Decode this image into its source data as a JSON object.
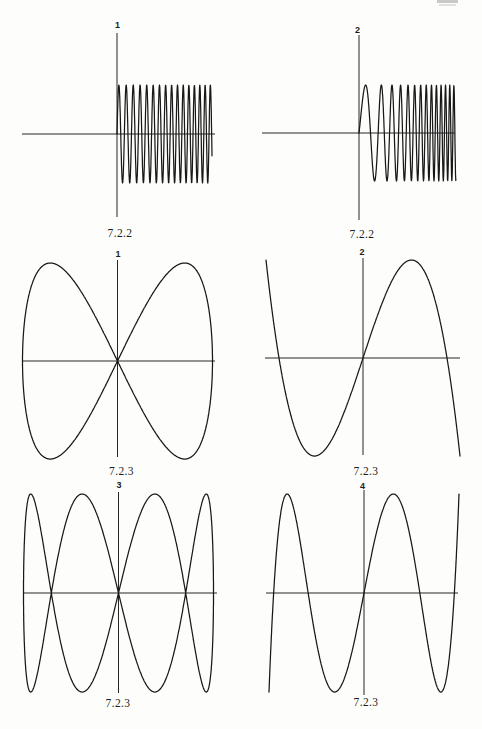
{
  "page": {
    "kind": "scanned textbook answer page with six function plots",
    "background": "#fdfdfb",
    "ink": "#1d1d1d",
    "header_artifact": {
      "note": "faint page-header text cropped off at the very top-right edge, illegible",
      "color": "#bfbfbf",
      "bars": [
        {
          "x": 437,
          "y": 0,
          "w": 21,
          "h": 3
        },
        {
          "x": 439,
          "y": 4,
          "w": 17,
          "h": 2
        }
      ]
    }
  },
  "chart_data": {
    "type": "line",
    "title": "",
    "grid": false,
    "legend": "none",
    "figures": [
      {
        "label": "1",
        "caption": "7.2.2",
        "curve_type": "chirp",
        "formula": "y = sin(phi(x)) for x >= 0; frequency slowly increasing, about 15.5 oscillations, amplitude 1",
        "x_range": [
          0,
          1
        ],
        "y_range": [
          -1,
          1
        ],
        "amplitude": 1,
        "oscillations": 15.6,
        "layout": {
          "origin": [
            117,
            134
          ],
          "vaxis": [
            33,
            217
          ],
          "haxis": [
            22,
            215
          ],
          "u_max": 95,
          "amp_px": 49,
          "b": 0.84,
          "a": 0.002,
          "label_pos": [
            117.5,
            21
          ],
          "caption_pos": [
            120,
            227
          ]
        }
      },
      {
        "label": "2",
        "caption": "7.2.2",
        "curve_type": "chirp",
        "formula": "y = sin(phi(x)) for x >= 0; chirp with strongly increasing frequency, about 14 oscillations, amplitude 1",
        "x_range": [
          0,
          1
        ],
        "y_range": [
          -1,
          1
        ],
        "amplitude": 1,
        "oscillations": 13.8,
        "layout": {
          "origin": [
            359,
            133
          ],
          "vaxis": [
            35,
            220
          ],
          "haxis": [
            262,
            455
          ],
          "u_max": 97,
          "amp_px": 48,
          "b": 0.19,
          "a": 0.00725,
          "label_pos": [
            357.5,
            26
          ],
          "caption_pos": [
            362,
            228
          ]
        }
      },
      {
        "label": "1",
        "caption": "7.2.3",
        "curve_type": "lissajous",
        "n": 2,
        "formula": "x = sin t, y = sin 2t, t in [0, 2pi] (bow-tie Lissajous figure crossing at the origin)",
        "x_range": [
          -1,
          1
        ],
        "y_range": [
          -1,
          1
        ],
        "layout": {
          "origin": [
            117.5,
            361
          ],
          "vaxis": [
            260,
            457
          ],
          "haxis": [
            22,
            215
          ],
          "A": 95,
          "B": 98,
          "t_range": [
            0,
            6.2832
          ],
          "label_pos": [
            118,
            250
          ],
          "caption_pos": [
            121.5,
            465
          ]
        }
      },
      {
        "label": "2",
        "caption": "7.2.3",
        "curve_type": "chebyshev",
        "n": 3,
        "formula": "y = sin(3 arcsin x) = 3x - 4x^3, x in [-1, 1]; ends at (-1,1) and (1,-1), extrema +-1 at x = +-1/2, zeros at 0 and +-0.866",
        "x_range": [
          -1,
          1
        ],
        "y_range": [
          -1,
          1
        ],
        "layout": {
          "origin": [
            363,
            358
          ],
          "vaxis": [
            258,
            455
          ],
          "haxis": [
            265,
            460
          ],
          "A": 97,
          "B": 98,
          "t_range": [
            -1.5708,
            1.5708
          ],
          "label_pos": [
            362,
            248
          ],
          "caption_pos": [
            366,
            465
          ]
        }
      },
      {
        "label": "3",
        "caption": "7.2.3",
        "curve_type": "lissajous",
        "n": 4,
        "formula": "x = sin t, y = sin 4t, t in [0, 2pi] (braided figure, axis crossings at x = 0 and x = +-0.707)",
        "x_range": [
          -1,
          1
        ],
        "y_range": [
          -1,
          1
        ],
        "layout": {
          "origin": [
            118.5,
            593
          ],
          "vaxis": [
            492,
            693
          ],
          "haxis": [
            23,
            217
          ],
          "A": 95,
          "B": 99,
          "t_range": [
            0,
            6.2832
          ],
          "label_pos": [
            119,
            481
          ],
          "caption_pos": [
            118,
            697
          ]
        }
      },
      {
        "label": "4",
        "caption": "7.2.3",
        "curve_type": "chebyshev",
        "n": 5,
        "formula": "y = sin(5 arcsin x) = 16x^5 - 20x^3 + 5x, x in [-1, 1]; extrema +-1 at x = +-0.309 and +-0.809, zeros at 0, +-0.588, +-0.951",
        "x_range": [
          -1,
          1
        ],
        "y_range": [
          -1,
          1
        ],
        "layout": {
          "origin": [
            364,
            593
          ],
          "vaxis": [
            490,
            695
          ],
          "haxis": [
            266,
            458
          ],
          "A": 95,
          "B": 99,
          "t_range": [
            -1.5708,
            1.5708
          ],
          "label_pos": [
            362.5,
            482
          ],
          "caption_pos": [
            366,
            696
          ]
        }
      }
    ]
  }
}
